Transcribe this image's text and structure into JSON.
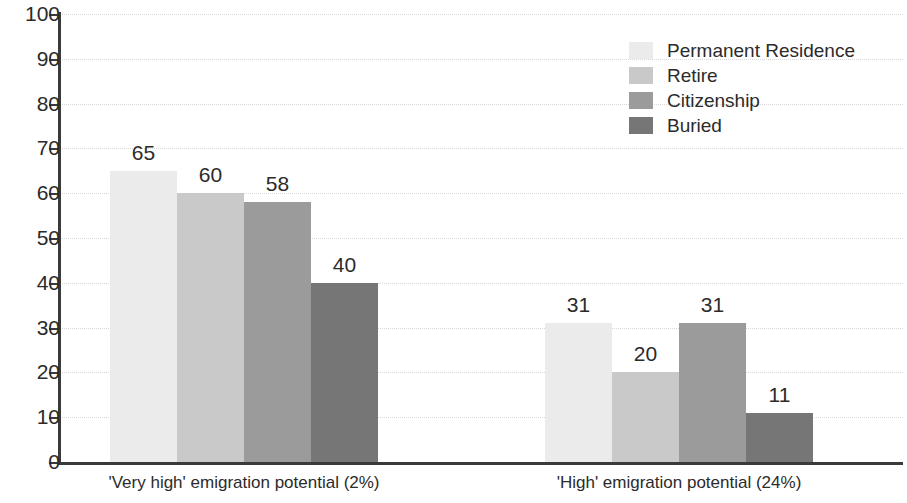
{
  "chart_data": {
    "type": "bar",
    "title": "",
    "subtitle": "",
    "xlabel": "",
    "ylabel": "",
    "ylim": [
      0,
      100
    ],
    "y_ticks": [
      0,
      10,
      20,
      30,
      40,
      50,
      60,
      70,
      80,
      90,
      100
    ],
    "grid": true,
    "legend_position": "top-right",
    "categories": [
      "'Very high' emigration potential (2%)",
      "'High' emigration potential (24%)"
    ],
    "series": [
      {
        "name": "Permanent Residence",
        "values": [
          65,
          31
        ],
        "color": "#ebebeb"
      },
      {
        "name": "Retire",
        "values": [
          60,
          20
        ],
        "color": "#c9c9c9"
      },
      {
        "name": "Citizenship",
        "values": [
          58,
          31
        ],
        "color": "#9b9b9b"
      },
      {
        "name": "Buried",
        "values": [
          40,
          11
        ],
        "color": "#767676"
      }
    ]
  },
  "axis": {
    "tick_labels": [
      "100",
      "90",
      "80",
      "70",
      "60",
      "50",
      "40",
      "30",
      "20",
      "10",
      "0"
    ]
  },
  "legend": {
    "items": [
      {
        "label": "Permanent Residence",
        "color": "#ebebeb"
      },
      {
        "label": "Retire",
        "color": "#c9c9c9"
      },
      {
        "label": "Citizenship",
        "color": "#9b9b9b"
      },
      {
        "label": "Buried",
        "color": "#767676"
      }
    ]
  }
}
